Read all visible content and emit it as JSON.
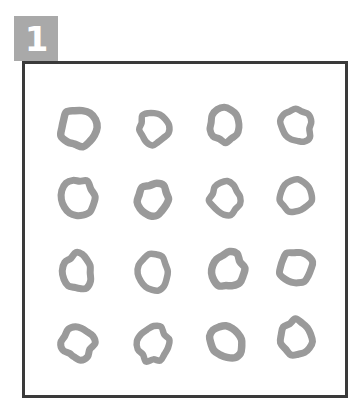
{
  "badge": {
    "label": "1",
    "background_color": "#a9a9a9",
    "text_color": "#ffffff"
  },
  "panel": {
    "border_color": "#3a3a3a",
    "background_color": "#ffffff",
    "border_width_px": 3
  },
  "grid": {
    "rows": 4,
    "columns": 4,
    "total_items": 16,
    "item_shape": "ring",
    "item_stroke_color": "#9a9a9a",
    "item_fill_color": "#ffffff",
    "description": "hand-drawn irregular rings arranged in a 4 by 4 grid"
  },
  "rings": [
    {
      "id": "ring-r1c1",
      "row": 1,
      "col": 1,
      "cx": 78,
      "cy": 127,
      "rx": 18,
      "ry": 18,
      "stroke": 7.5,
      "rotate": 0,
      "wobble": 0.1
    },
    {
      "id": "ring-r1c2",
      "row": 1,
      "col": 2,
      "cx": 153,
      "cy": 127,
      "rx": 14,
      "ry": 16,
      "stroke": 6.5,
      "rotate": -8,
      "wobble": 0.13
    },
    {
      "id": "ring-r1c3",
      "row": 1,
      "col": 3,
      "cx": 225,
      "cy": 125,
      "rx": 15,
      "ry": 16,
      "stroke": 7.0,
      "rotate": 10,
      "wobble": 0.12
    },
    {
      "id": "ring-r1c4",
      "row": 1,
      "col": 4,
      "cx": 296,
      "cy": 125,
      "rx": 15,
      "ry": 17,
      "stroke": 6.5,
      "rotate": -14,
      "wobble": 0.14
    },
    {
      "id": "ring-r2c1",
      "row": 2,
      "col": 1,
      "cx": 78,
      "cy": 198,
      "rx": 16,
      "ry": 19,
      "stroke": 7.0,
      "rotate": -5,
      "wobble": 0.11
    },
    {
      "id": "ring-r2c2",
      "row": 2,
      "col": 2,
      "cx": 153,
      "cy": 200,
      "rx": 15,
      "ry": 16,
      "stroke": 7.5,
      "rotate": 22,
      "wobble": 0.16
    },
    {
      "id": "ring-r2c3",
      "row": 2,
      "col": 3,
      "cx": 225,
      "cy": 198,
      "rx": 15,
      "ry": 16,
      "stroke": 6.5,
      "rotate": -6,
      "wobble": 0.12
    },
    {
      "id": "ring-r2c4",
      "row": 2,
      "col": 4,
      "cx": 296,
      "cy": 196,
      "rx": 15,
      "ry": 17,
      "stroke": 6.5,
      "rotate": 16,
      "wobble": 0.13
    },
    {
      "id": "ring-r3c1",
      "row": 3,
      "col": 1,
      "cx": 78,
      "cy": 272,
      "rx": 14,
      "ry": 18,
      "stroke": 7.0,
      "rotate": 4,
      "wobble": 0.13
    },
    {
      "id": "ring-r3c2",
      "row": 3,
      "col": 2,
      "cx": 153,
      "cy": 272,
      "rx": 15,
      "ry": 18,
      "stroke": 6.5,
      "rotate": -4,
      "wobble": 0.11
    },
    {
      "id": "ring-r3c3",
      "row": 3,
      "col": 3,
      "cx": 227,
      "cy": 270,
      "rx": 16,
      "ry": 17,
      "stroke": 7.5,
      "rotate": 18,
      "wobble": 0.15
    },
    {
      "id": "ring-r3c4",
      "row": 3,
      "col": 4,
      "cx": 296,
      "cy": 268,
      "rx": 16,
      "ry": 16,
      "stroke": 7.0,
      "rotate": -20,
      "wobble": 0.14
    },
    {
      "id": "ring-r4c1",
      "row": 4,
      "col": 1,
      "cx": 78,
      "cy": 343,
      "rx": 15,
      "ry": 16,
      "stroke": 7.0,
      "rotate": 28,
      "wobble": 0.17
    },
    {
      "id": "ring-r4c2",
      "row": 4,
      "col": 2,
      "cx": 153,
      "cy": 344,
      "rx": 15,
      "ry": 17,
      "stroke": 6.5,
      "rotate": 12,
      "wobble": 0.15
    },
    {
      "id": "ring-r4c3",
      "row": 4,
      "col": 3,
      "cx": 226,
      "cy": 341,
      "rx": 17,
      "ry": 15,
      "stroke": 7.5,
      "rotate": 40,
      "wobble": 0.14
    },
    {
      "id": "ring-r4c4",
      "row": 4,
      "col": 4,
      "cx": 297,
      "cy": 338,
      "rx": 16,
      "ry": 18,
      "stroke": 7.0,
      "rotate": -16,
      "wobble": 0.13
    }
  ]
}
